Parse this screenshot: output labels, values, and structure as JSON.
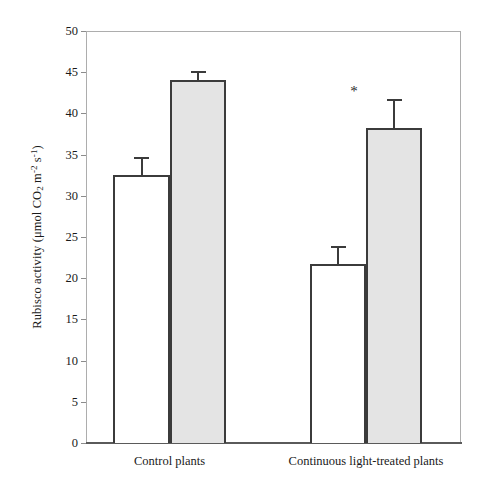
{
  "chart_data": {
    "type": "bar",
    "title": "",
    "subtitle": "",
    "xlabel": "",
    "ylabel": "Rubisco activity (μmol CO2 m-2 s-1)",
    "ylabel_parts": {
      "prefix": "Rubisco activity (μmol CO",
      "sub1": "2",
      "mid": " m",
      "sup1": "-2",
      "mid2": " s",
      "sup2": "-1",
      "suffix": ")"
    },
    "categories": [
      "Control plants",
      "Continuous light-treated plants"
    ],
    "series": [
      {
        "name": "Open bar",
        "style": "open",
        "values": [
          32.5,
          21.7
        ],
        "errors": [
          2.2,
          2.2
        ]
      },
      {
        "name": "Shaded bar",
        "style": "shaded",
        "values": [
          44.0,
          38.2
        ],
        "errors": [
          1.1,
          3.6
        ]
      }
    ],
    "bars": [
      {
        "group": "Control plants",
        "series": "Open bar",
        "value": 32.5,
        "error": 2.2,
        "style": "open",
        "annotation": ""
      },
      {
        "group": "Control plants",
        "series": "Shaded bar",
        "value": 44.0,
        "error": 1.1,
        "style": "shaded",
        "annotation": ""
      },
      {
        "group": "Continuous light-treated plants",
        "series": "Open bar",
        "value": 21.7,
        "error": 2.2,
        "style": "open",
        "annotation": ""
      },
      {
        "group": "Continuous light-treated plants",
        "series": "Shaded bar",
        "value": 38.2,
        "error": 3.6,
        "style": "shaded",
        "annotation": "*"
      }
    ],
    "ylim": [
      0,
      50
    ],
    "yticks": [
      0,
      5,
      10,
      15,
      20,
      25,
      30,
      35,
      40,
      45,
      50
    ],
    "ytick_labels": [
      "0",
      "5",
      "10",
      "15",
      "20",
      "25",
      "30",
      "35",
      "40",
      "45",
      "50"
    ],
    "grid": false,
    "legend": null,
    "legend_position": "none",
    "annotations": [
      {
        "text": "*",
        "target": "Continuous light-treated plants / Shaded bar",
        "meaning": "significant difference"
      }
    ],
    "colors": {
      "open_bar_fill": "#ffffff",
      "shaded_bar_fill": "#e4e4e4",
      "bar_outline": "#3b3b3b",
      "axis": "#8c8c8c",
      "text": "#1a1a1a"
    }
  }
}
